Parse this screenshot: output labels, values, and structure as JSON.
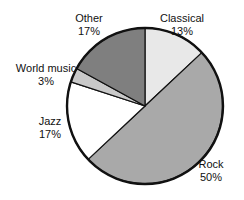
{
  "chart_data": {
    "type": "pie",
    "title": "",
    "subtitle": "",
    "xlabel": "",
    "ylabel": "",
    "legend_position": "none",
    "grid": false,
    "categories": [
      "Classical",
      "Rock",
      "Jazz",
      "World music",
      "Other"
    ],
    "values": [
      13,
      50,
      17,
      3,
      17
    ],
    "value_suffix": "%",
    "slices": [
      {
        "label": "Classical",
        "value": 13,
        "value_text": "13%",
        "color": "#e8e8e8",
        "start_angle": 0,
        "end_angle": 46.8
      },
      {
        "label": "Rock",
        "value": 50,
        "value_text": "50%",
        "color": "#a9a9a9",
        "start_angle": 46.8,
        "end_angle": 226.8
      },
      {
        "label": "Jazz",
        "value": 17,
        "value_text": "17%",
        "color": "#ffffff",
        "start_angle": 226.8,
        "end_angle": 288.0
      },
      {
        "label": "World music",
        "value": 3,
        "value_text": "3%",
        "color": "#c9c9c9",
        "start_angle": 288.0,
        "end_angle": 298.8
      },
      {
        "label": "Other",
        "value": 17,
        "value_text": "17%",
        "color": "#7f7f7f",
        "start_angle": 298.8,
        "end_angle": 360.0
      }
    ],
    "geometry": {
      "center_x": 145,
      "center_y": 106,
      "radius": 78
    },
    "style": {
      "background": "#ffffff",
      "outline_color": "#111111",
      "outline_width": 2.4,
      "divider_color": "#111111",
      "divider_width": 1.2,
      "label_color": "#111111"
    }
  }
}
